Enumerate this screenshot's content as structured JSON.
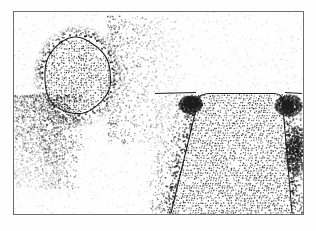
{
  "figure": {
    "title": "Stippled line drawing: plan and section",
    "medium": "pen-and-ink stipple on white ground",
    "background_color": "#fefefe",
    "ink_color": "#1d1d1d",
    "frame": {
      "name": "illustration-border",
      "x": 13,
      "y": 11,
      "width": 290,
      "height": 203,
      "stroke_color": "#6e6e6e",
      "stroke_width": 1
    },
    "panels": [
      {
        "id": "plan-view",
        "label": "plan view",
        "description": "oval feature outlined in ink with dense stipple halo",
        "shape": "oval",
        "center_x": 77,
        "center_y": 76,
        "radius_x": 33,
        "radius_y": 38,
        "outline_color": "#1d1d1d",
        "outline_width": 1.1,
        "fill_stipple_density": 0.46,
        "halo_stipple_density": 0.72,
        "halo_spread": 44,
        "scatter_plume": {
          "description": "stipple plume trailing to lower-left",
          "origin_x": 70,
          "origin_y": 108,
          "spread_x": 70,
          "spread_y": 90,
          "density": 0.3
        }
      },
      {
        "id": "section-view",
        "label": "section view",
        "description": "trapezoidal cut widening with depth below a horizontal ground line",
        "shape": "trapezoid",
        "ground_line": {
          "name": "ground-surface-line",
          "x1": 155,
          "x2": 302,
          "y": 93,
          "stroke_color": "#1d1d1d",
          "stroke_width": 1.2
        },
        "top_left_x": 200,
        "top_right_x": 281,
        "top_y": 95,
        "bottom_left_x": 171,
        "bottom_right_x": 292,
        "bottom_y": 213,
        "outline_color": "#1d1d1d",
        "outline_width": 1.1,
        "fill_stipple_density": 0.52,
        "flank_stipple_density": 0.55,
        "rubble_clusters": [
          {
            "name": "rubble-cluster-left",
            "cx": 190,
            "cy": 104,
            "rx": 12,
            "ry": 9
          },
          {
            "name": "rubble-cluster-right",
            "cx": 288,
            "cy": 105,
            "rx": 14,
            "ry": 11
          },
          {
            "name": "rubble-cluster-right-lower",
            "cx": 296,
            "cy": 150,
            "rx": 12,
            "ry": 26
          }
        ]
      }
    ],
    "stipple": {
      "dot_size_min": 0.5,
      "dot_size_max": 1.1,
      "total_dots_approx": 21000,
      "seed": 20240517
    }
  }
}
